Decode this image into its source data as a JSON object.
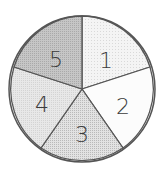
{
  "diagram": {
    "type": "divided-circle",
    "sector_count": 5,
    "center": [
      82,
      89
    ],
    "radius": 73,
    "outline_color": "#555555",
    "sectors": [
      {
        "label": "1",
        "position": "top-right",
        "fill": "#f0f0f0",
        "pattern": "fine-dots"
      },
      {
        "label": "2",
        "position": "right",
        "fill": "#fcfcfc",
        "pattern": "none"
      },
      {
        "label": "3",
        "position": "bottom",
        "fill": "#d6d6d6",
        "pattern": "dense-dots"
      },
      {
        "label": "4",
        "position": "left",
        "fill": "#e3e3e3",
        "pattern": "light-dots"
      },
      {
        "label": "5",
        "position": "top-left",
        "fill": "#bcbcbc",
        "pattern": "medium-dots"
      }
    ]
  }
}
